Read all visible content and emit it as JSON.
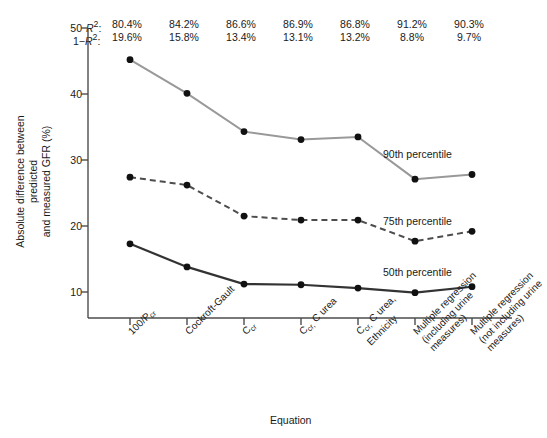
{
  "chart_data": {
    "type": "line",
    "title": "",
    "xlabel": "Equation",
    "ylabel": "Absolute difference between predicted and measured GFR (%)",
    "ylim": [
      7,
      50
    ],
    "yticks": [
      10,
      20,
      30,
      40,
      50
    ],
    "ytick_labels": [
      "10",
      "20",
      "30",
      "40",
      "50"
    ],
    "grid": false,
    "legend_position": "inline-right",
    "categories": [
      "100/P cr",
      "Cockroft-Gault",
      "C cr",
      "C cr, C urea",
      "C cr, C urea, Ethnicity",
      "Multiple regression (including urine measures)",
      "Multiple regression (not including urine measures)"
    ],
    "series": [
      {
        "name": "90th percentile",
        "values": [
          45.2,
          40.1,
          34.3,
          33.1,
          33.5,
          27.1,
          27.8
        ],
        "style": "solid-light",
        "color": "#999999"
      },
      {
        "name": "75th percentile",
        "values": [
          27.4,
          26.2,
          21.5,
          20.9,
          20.9,
          17.7,
          19.2
        ],
        "style": "dashed",
        "color": "#4d4d4d"
      },
      {
        "name": "50th percentile",
        "values": [
          17.3,
          13.8,
          11.2,
          11.1,
          10.6,
          9.9,
          10.8
        ],
        "style": "solid-dark",
        "color": "#333333"
      }
    ],
    "annotations": {
      "row1_label": "R²:",
      "row2_label": "1−R²:",
      "row1_values": [
        "80.4%",
        "84.2%",
        "86.6%",
        "86.9%",
        "86.8%",
        "91.2%",
        "90.3%"
      ],
      "row2_values": [
        "19.6%",
        "15.8%",
        "13.4%",
        "13.1%",
        "13.2%",
        "8.8%",
        "9.7%"
      ]
    }
  },
  "xaxis_tick_labels": [
    {
      "main": "100/P",
      "sub": "cr",
      "tail": ""
    },
    {
      "main": "Cockroft-Gault",
      "sub": "",
      "tail": ""
    },
    {
      "main": "C",
      "sub": "cr",
      "tail": ""
    },
    {
      "main": "C",
      "sub": "cr,",
      "tail": " C urea"
    },
    {
      "main": "C",
      "sub": "cr,",
      "tail": " C urea,"
    },
    {
      "main": "Multiple regression",
      "sub": "",
      "tail": ""
    },
    {
      "main": "Multiple regression",
      "sub": "",
      "tail": ""
    }
  ],
  "xaxis_tick_lines": [
    [
      "100/P|cr"
    ],
    [
      "Cockroft-Gault"
    ],
    [
      "C|cr"
    ],
    [
      "C|cr, C urea"
    ],
    [
      "C|cr, C urea,",
      "Ethnicity"
    ],
    [
      "Multiple regression",
      "(including urine",
      "measures)"
    ],
    [
      "Multiple regression",
      "(not including urine",
      "measures)"
    ]
  ],
  "yaxis": {
    "title_line1": "Absolute difference between predicted",
    "title_line2": "and measured GFR (%)"
  },
  "xaxis": {
    "title": "Equation"
  },
  "series_labels": {
    "p90": "90th percentile",
    "p75": "75th percentile",
    "p50": "50th percentile"
  }
}
